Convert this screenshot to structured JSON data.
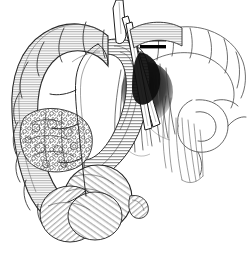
{
  "figure": {
    "style": "black-and-white pen-and-ink line engraving with hatching",
    "background_color": "#ffffff",
    "ink_color": "#1a1a1a",
    "hatch_color": "#4a4a4a",
    "shadow_color": "#000000",
    "width": 249,
    "height": 257,
    "alt_text": "Pen and ink anatomical drawing of the large bowel showing a nodular tumor mass on the ascending colon, the cecum below, surgical forceps and ligature clips on the mesenteric vessels, and outlined small bowel loops at the right"
  },
  "labels": {
    "ascending_colon": "ascending colon",
    "haustra": "haustra",
    "tumor_mass": "tumor mass",
    "cecum": "cecum",
    "appendix": "appendix",
    "transverse_colon": "transverse colon",
    "small_bowel_loop": "small bowel loop",
    "mesentery": "mesentery",
    "vessel_arcade": "vessel arcade",
    "forceps": "forceps",
    "instrument_shaft": "instrument shaft",
    "ligature_clips": "ligature clips",
    "shadow": "shadow"
  },
  "elements": {
    "ligature_clip_count": 2,
    "instrument_count": 2,
    "vessel_fan_lines": 14,
    "haustral_segments": 12
  }
}
